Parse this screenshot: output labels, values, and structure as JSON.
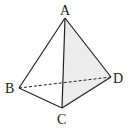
{
  "diagram": {
    "type": "tetrahedron",
    "vertices": {
      "A": {
        "label": "A",
        "x": 65,
        "y": 18
      },
      "B": {
        "label": "B",
        "x": 19,
        "y": 88
      },
      "C": {
        "label": "C",
        "x": 62,
        "y": 108
      },
      "D": {
        "label": "D",
        "x": 111,
        "y": 77
      }
    },
    "edges": [
      {
        "from": "A",
        "to": "B",
        "style": "solid"
      },
      {
        "from": "A",
        "to": "C",
        "style": "solid"
      },
      {
        "from": "A",
        "to": "D",
        "style": "solid"
      },
      {
        "from": "B",
        "to": "C",
        "style": "solid"
      },
      {
        "from": "C",
        "to": "D",
        "style": "solid"
      },
      {
        "from": "B",
        "to": "D",
        "style": "dashed"
      }
    ],
    "shaded_face": [
      "A",
      "C",
      "D"
    ],
    "colors": {
      "line": "#222222",
      "shade": "#ececec",
      "background": "#ffffff"
    }
  }
}
